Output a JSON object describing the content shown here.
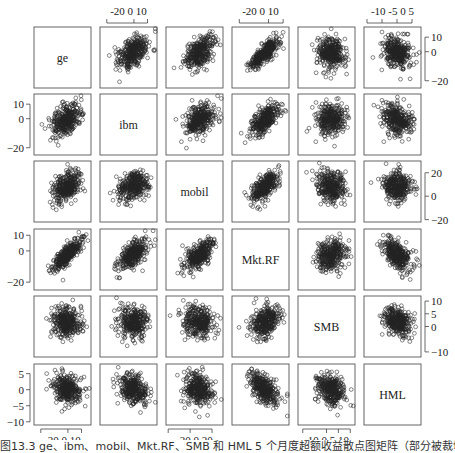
{
  "chart_data": {
    "type": "scatter",
    "subtype": "scatterplot-matrix",
    "variables": [
      "ge",
      "ibm",
      "mobil",
      "Mkt.RF",
      "SMB",
      "HML"
    ],
    "axes": {
      "ge": {
        "ticks": [
          -20,
          0,
          10
        ],
        "range": [
          -25,
          17
        ]
      },
      "ibm": {
        "ticks": [
          -20,
          0,
          10
        ],
        "range": [
          -25,
          17
        ]
      },
      "mobil": {
        "ticks": [
          -20,
          0,
          20
        ],
        "range": [
          -22,
          30
        ]
      },
      "Mkt.RF": {
        "ticks": [
          -20,
          0,
          10
        ],
        "range": [
          -25,
          14
        ]
      },
      "SMB": {
        "ticks": [
          -10,
          0,
          5,
          10
        ],
        "range": [
          -12,
          12
        ]
      },
      "HML": {
        "ticks": [
          -10,
          -5,
          0,
          5
        ],
        "range": [
          -11,
          8
        ]
      }
    },
    "tick_labels": {
      "top": [
        {
          "col": 1,
          "labels": [
            "-20",
            "0 10"
          ]
        },
        {
          "col": 3,
          "labels": [
            "-20",
            "0 10"
          ]
        },
        {
          "col": 5,
          "labels": [
            "-10",
            "-5",
            "0",
            "5"
          ]
        }
      ],
      "bottom": [
        {
          "col": 0,
          "labels": [
            "-20",
            "0 10"
          ]
        },
        {
          "col": 2,
          "labels": [
            "-20",
            "0",
            "20"
          ]
        },
        {
          "col": 4,
          "labels": [
            "-10",
            "0 5 10"
          ]
        }
      ],
      "left": [
        {
          "row": 1,
          "labels": [
            "10",
            "0",
            "-20"
          ]
        },
        {
          "row": 3,
          "labels": [
            "10",
            "0",
            "-20"
          ]
        },
        {
          "row": 5,
          "labels": [
            "5",
            "0",
            "-5",
            "-10"
          ]
        }
      ],
      "right": [
        {
          "row": 0,
          "labels": [
            "10",
            "0",
            "-20"
          ]
        },
        {
          "row": 2,
          "labels": [
            "20",
            "0",
            "-20"
          ]
        },
        {
          "row": 4,
          "labels": [
            "10",
            "5",
            "0",
            "-10"
          ]
        }
      ]
    },
    "correlations_visual": {
      "ge-ibm": 0.45,
      "ge-mobil": 0.4,
      "ge-Mkt.RF": 0.8,
      "ge-SMB": -0.1,
      "ge-HML": -0.25,
      "ibm-mobil": 0.3,
      "ibm-Mkt.RF": 0.6,
      "ibm-SMB": 0.0,
      "ibm-HML": -0.3,
      "mobil-Mkt.RF": 0.65,
      "mobil-SMB": -0.1,
      "mobil-HML": -0.15,
      "Mkt.RF-SMB": 0.2,
      "Mkt.RF-HML": -0.45,
      "SMB-HML": -0.3
    },
    "n_points_per_panel": 330,
    "marker": "open-circle",
    "grid": false,
    "title": "",
    "legend": null
  },
  "caption": "图13.3  ge、ibm、mobil、Mkt.RF、SMB 和 HML 5 个月度超额收益散点图矩阵（部分被裁切）"
}
